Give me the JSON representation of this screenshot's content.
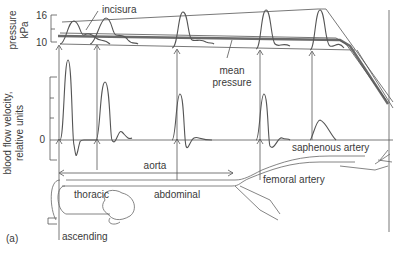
{
  "figure": {
    "panel_label": "(a)",
    "pressure_axis": {
      "label_line1": "pressure",
      "label_line2": "kPa",
      "tick_high": "16",
      "tick_low": "10"
    },
    "velocity_axis": {
      "label_line1": "blood flow velocity,",
      "label_line2": "relative units",
      "tick_zero": "0"
    },
    "annotations": {
      "incisura": "incisura",
      "mean_pressure_line1": "mean",
      "mean_pressure_line2": "pressure"
    },
    "anatomy_labels": {
      "aorta": "aorta",
      "thoracic": "thoracic",
      "abdominal": "abdominal",
      "ascending": "ascending",
      "femoral": "femoral artery",
      "saphenous": "saphenous artery"
    },
    "measurement_sites": [
      "ascending",
      "thoracic",
      "abdominal",
      "femoral artery",
      "saphenous artery"
    ],
    "colors": {
      "line": "#555555",
      "mean_pressure": "#6a6a6a",
      "text": "#3a3a3a",
      "background": "#ffffff"
    }
  }
}
